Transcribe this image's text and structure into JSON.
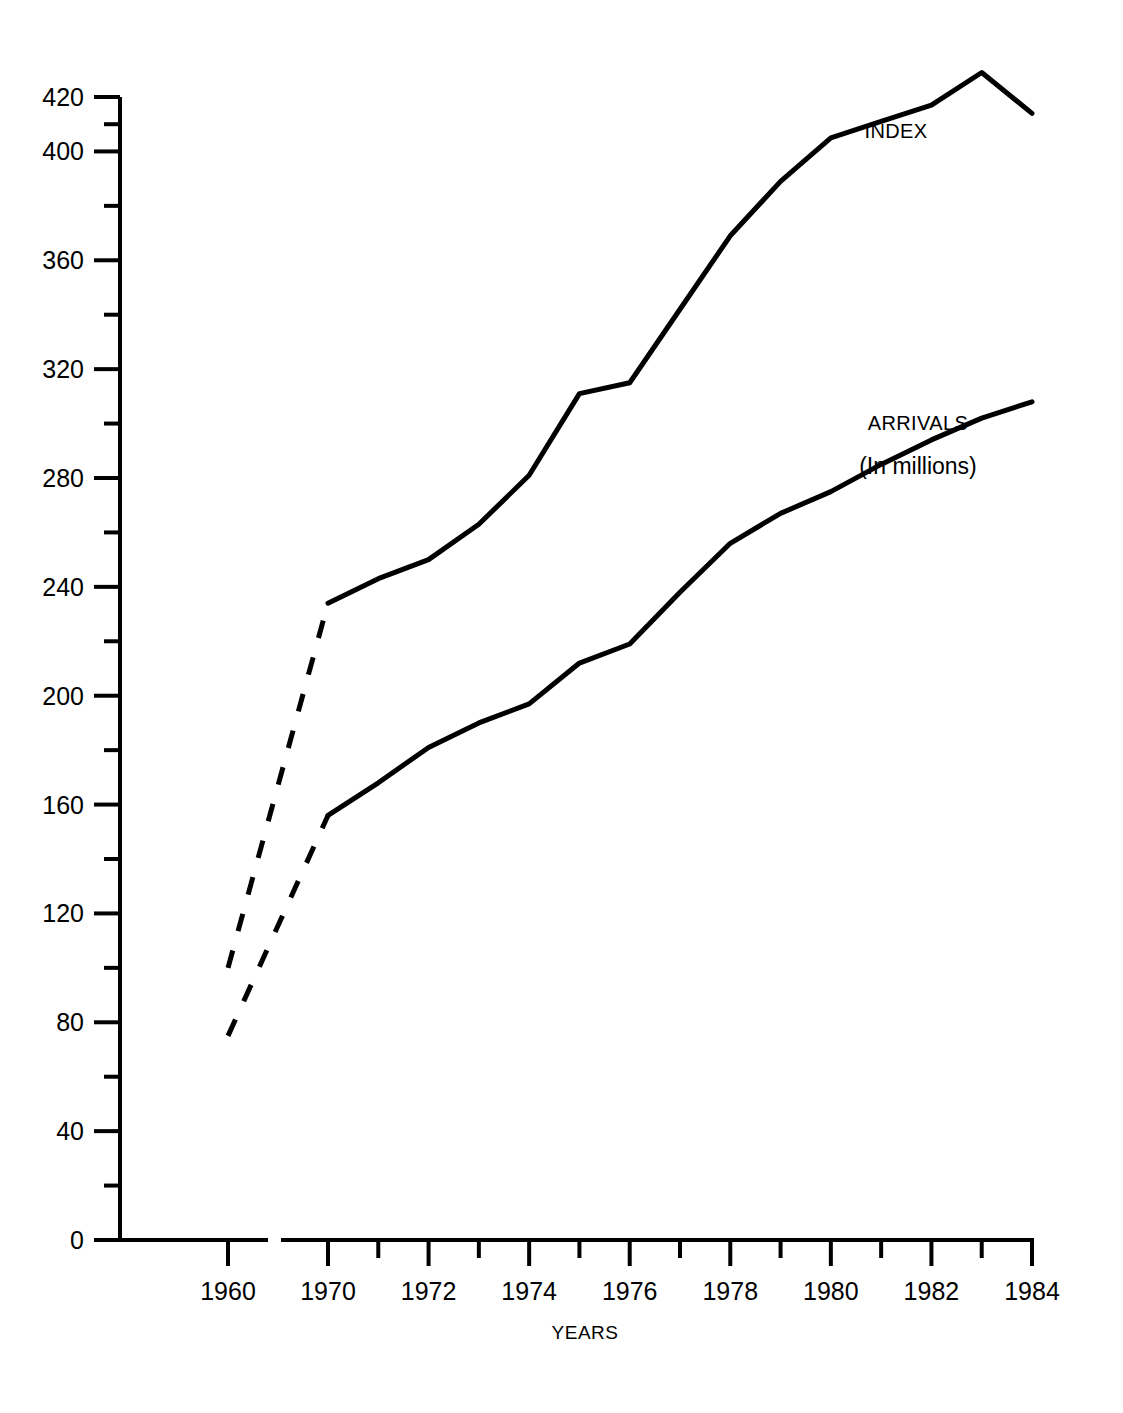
{
  "chart_data": {
    "type": "line",
    "title": "",
    "xlabel": "YEARS",
    "ylabel": "",
    "xlim": [
      1960,
      1984
    ],
    "ylim": [
      0,
      420
    ],
    "grid": false,
    "axis_break": {
      "present": true,
      "between": [
        1960,
        1970
      ],
      "note": "x-axis is broken between 1960 and 1970"
    },
    "y_ticks_major": [
      0,
      40,
      80,
      120,
      160,
      200,
      240,
      280,
      320,
      360,
      400,
      420
    ],
    "y_ticks_minor": [
      20,
      60,
      100,
      140,
      180,
      220,
      260,
      300,
      340,
      380,
      410
    ],
    "x_ticks_major": [
      1960,
      1970,
      1972,
      1974,
      1976,
      1978,
      1980,
      1982,
      1984
    ],
    "x_ticks_minor": [
      1971,
      1973,
      1975,
      1977,
      1979,
      1981,
      1983
    ],
    "x_tick_labels": [
      "1960",
      "1970",
      "1972",
      "1974",
      "1976",
      "1978",
      "1980",
      "1982",
      "1984"
    ],
    "y_tick_labels": [
      "0",
      "40",
      "80",
      "120",
      "160",
      "200",
      "240",
      "280",
      "320",
      "360",
      "400",
      "420"
    ],
    "legend_position": "inline-annotation",
    "series": [
      {
        "name": "INDEX",
        "label": "INDEX",
        "sublabel": "",
        "style": "solid-with-dashed-gap",
        "x": [
          1960,
          1970,
          1971,
          1972,
          1973,
          1974,
          1975,
          1976,
          1977,
          1978,
          1979,
          1980,
          1981,
          1982,
          1983,
          1984
        ],
        "values": [
          100,
          234,
          243,
          250,
          263,
          281,
          311,
          315,
          342,
          369,
          389,
          405,
          411,
          417,
          429,
          414
        ],
        "dashed_from": 1960,
        "dashed_to": 1970
      },
      {
        "name": "ARRIVALS",
        "label": "ARRIVALS",
        "sublabel": "(In millions)",
        "style": "solid-with-dashed-gap",
        "x": [
          1960,
          1970,
          1971,
          1972,
          1973,
          1974,
          1975,
          1976,
          1977,
          1978,
          1979,
          1980,
          1981,
          1982,
          1983,
          1984
        ],
        "values": [
          75,
          156,
          168,
          181,
          190,
          197,
          212,
          219,
          238,
          256,
          267,
          275,
          285,
          294,
          302,
          308
        ],
        "dashed_from": 1960,
        "dashed_to": 1970
      }
    ],
    "annotations": [
      {
        "text": "INDEX",
        "series": "INDEX"
      },
      {
        "text": "ARRIVALS",
        "series": "ARRIVALS"
      },
      {
        "text": "(In millions)",
        "series": "ARRIVALS"
      }
    ]
  },
  "labels": {
    "index_label": "INDEX",
    "arrivals_label": "ARRIVALS",
    "arrivals_sublabel": "(In millions)",
    "x_axis_title": "YEARS"
  },
  "colors": {
    "line": "#000000",
    "axis": "#000000",
    "background": "#ffffff"
  }
}
